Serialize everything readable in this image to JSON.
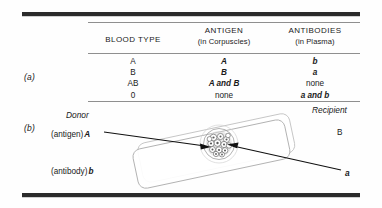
{
  "figure": {
    "panel_a_letter": "(a)",
    "panel_b_letter": "(b)"
  },
  "table": {
    "headers": [
      {
        "main": "BLOOD TYPE",
        "sub": ""
      },
      {
        "main": "ANTIGEN",
        "sub": "(in Corpuscles)"
      },
      {
        "main": "ANTIBODIES",
        "sub": "(in Plasma)"
      }
    ],
    "rows": [
      {
        "type": "A",
        "antigen": "A",
        "antibodies": "b"
      },
      {
        "type": "B",
        "antigen": "B",
        "antibodies": "a"
      },
      {
        "type": "AB",
        "antigen": "A and B",
        "antibodies": "none"
      },
      {
        "type": "0",
        "antigen": "none",
        "antibodies": "a and b"
      }
    ]
  },
  "panel_b": {
    "donor_label": "Donor",
    "recipient_label": "Recipient",
    "antigen_label": "(antigen)",
    "antigen_value": "A",
    "antibody_label": "(antibody)",
    "antibody_value": "b",
    "recipient_type": "B",
    "recipient_antibody": "a",
    "slide_name": "microscope-slide",
    "clump_name": "agglutination-clump"
  },
  "colors": {
    "rule_heavy": "#2b2b2b",
    "rule_light": "#8f8f8f",
    "slide_outline": "#b5b5b5",
    "arrow": "#111111",
    "text": "#1a1a1a",
    "background": "#fefefe"
  }
}
